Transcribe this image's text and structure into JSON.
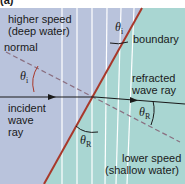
{
  "figure_label": "(a)",
  "regions": {
    "deep": {
      "line1": "higher speed",
      "line2": "(deep water)",
      "color": "#b9c3dc"
    },
    "shallow": {
      "line1": "lower speed",
      "line2": "(shallow water)",
      "color": "#a9d6d2"
    }
  },
  "labels": {
    "normal": "normal",
    "boundary": "boundary",
    "incident": [
      "incident",
      "wave",
      "ray"
    ],
    "refracted": [
      "refracted",
      "wave ray"
    ]
  },
  "angles": {
    "theta_i_symbol": "θ",
    "theta_i_sub": "i",
    "theta_r_symbol": "θ",
    "theta_r_sub": "R"
  },
  "colors": {
    "boundary": "#a8382a",
    "ray": "#1a1a1a",
    "normal": "#8a6f80",
    "wavefront": "#ffffff"
  }
}
